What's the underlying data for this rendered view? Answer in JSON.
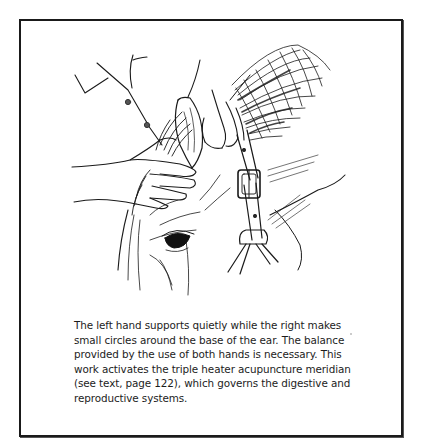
{
  "figure": {
    "illustration_subject": "Hands working at the base of a horse's ear, horse wearing a halter with buckle",
    "caption_lines": [
      "The left hand supports quietly while the right makes",
      "small circles around the base of the ear. The balance",
      "provided by the use of both hands is necessary. This",
      "work activates the triple heater acupuncture meridian",
      "(see text, page 122), which governs the digestive and",
      "reproductive systems."
    ]
  },
  "colors": {
    "ink": "#1a1a1a",
    "paper": "#ffffff"
  }
}
